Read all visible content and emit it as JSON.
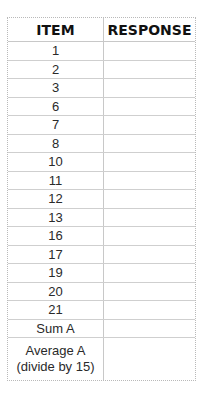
{
  "table": {
    "headers": [
      "ITEM",
      "RESPONSE"
    ],
    "rows": [
      {
        "item": "1",
        "response": ""
      },
      {
        "item": "2",
        "response": ""
      },
      {
        "item": "3",
        "response": ""
      },
      {
        "item": "6",
        "response": ""
      },
      {
        "item": "7",
        "response": ""
      },
      {
        "item": "8",
        "response": ""
      },
      {
        "item": "10",
        "response": ""
      },
      {
        "item": "11",
        "response": ""
      },
      {
        "item": "12",
        "response": ""
      },
      {
        "item": "13",
        "response": ""
      },
      {
        "item": "16",
        "response": ""
      },
      {
        "item": "17",
        "response": ""
      },
      {
        "item": "19",
        "response": ""
      },
      {
        "item": "20",
        "response": ""
      },
      {
        "item": "21",
        "response": ""
      },
      {
        "item": "Sum A",
        "response": ""
      }
    ],
    "average_row": {
      "line1": "Average A",
      "line2": "(divide by 15)",
      "response": ""
    }
  }
}
